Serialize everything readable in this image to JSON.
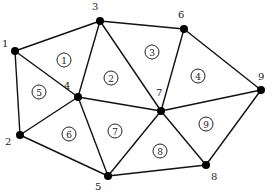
{
  "diagram": {
    "type": "finite-element-triangular-mesh",
    "nodes": [
      {
        "id": "1",
        "x": 15,
        "y": 51,
        "lx": 2,
        "ly": 47
      },
      {
        "id": "2",
        "x": 20,
        "y": 135,
        "lx": 5,
        "ly": 145
      },
      {
        "id": "3",
        "x": 100,
        "y": 21,
        "lx": 92,
        "ly": 10
      },
      {
        "id": "4",
        "x": 78,
        "y": 97,
        "lx": 64,
        "ly": 89
      },
      {
        "id": "5",
        "x": 108,
        "y": 176,
        "lx": 95,
        "ly": 190
      },
      {
        "id": "6",
        "x": 184,
        "y": 29,
        "lx": 178,
        "ly": 18
      },
      {
        "id": "7",
        "x": 161,
        "y": 111,
        "lx": 156,
        "ly": 96
      },
      {
        "id": "8",
        "x": 206,
        "y": 165,
        "lx": 211,
        "ly": 180
      },
      {
        "id": "9",
        "x": 261,
        "y": 90,
        "lx": 258,
        "ly": 80
      }
    ],
    "edges": [
      [
        "1",
        "3"
      ],
      [
        "3",
        "6"
      ],
      [
        "6",
        "9"
      ],
      [
        "9",
        "8"
      ],
      [
        "8",
        "5"
      ],
      [
        "5",
        "2"
      ],
      [
        "2",
        "1"
      ],
      [
        "1",
        "4"
      ],
      [
        "3",
        "4"
      ],
      [
        "3",
        "7"
      ],
      [
        "6",
        "7"
      ],
      [
        "4",
        "7"
      ],
      [
        "7",
        "9"
      ],
      [
        "2",
        "4"
      ],
      [
        "4",
        "5"
      ],
      [
        "5",
        "7"
      ],
      [
        "7",
        "8"
      ]
    ],
    "elements": [
      {
        "id": "1",
        "nodes": [
          "1",
          "3",
          "4"
        ],
        "x": 64,
        "y": 60
      },
      {
        "id": "2",
        "nodes": [
          "3",
          "4",
          "7"
        ],
        "x": 111,
        "y": 78
      },
      {
        "id": "3",
        "nodes": [
          "3",
          "6",
          "7"
        ],
        "x": 152,
        "y": 52
      },
      {
        "id": "4",
        "nodes": [
          "6",
          "7",
          "9"
        ],
        "x": 198,
        "y": 76
      },
      {
        "id": "5",
        "nodes": [
          "1",
          "2",
          "4"
        ],
        "x": 39,
        "y": 92
      },
      {
        "id": "6",
        "nodes": [
          "2",
          "4",
          "5"
        ],
        "x": 69,
        "y": 134
      },
      {
        "id": "7",
        "nodes": [
          "4",
          "5",
          "7"
        ],
        "x": 115,
        "y": 131
      },
      {
        "id": "8",
        "nodes": [
          "5",
          "7",
          "8"
        ],
        "x": 160,
        "y": 151
      },
      {
        "id": "9",
        "nodes": [
          "7",
          "8",
          "9"
        ],
        "x": 206,
        "y": 124
      }
    ],
    "colors": {
      "line": "#111111",
      "node": "#000000",
      "background": "#ffffff"
    }
  }
}
